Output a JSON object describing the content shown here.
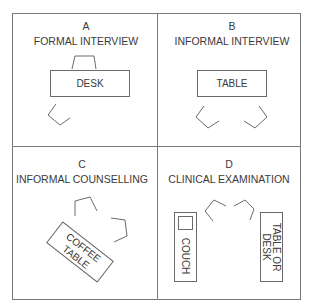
{
  "panels": [
    {
      "letter": "A",
      "title": "FORMAL INTERVIEW",
      "furniture": [
        "DESK"
      ],
      "chairs": 2
    },
    {
      "letter": "B",
      "title": "INFORMAL INTERVIEW",
      "furniture": [
        "TABLE"
      ],
      "chairs": 2
    },
    {
      "letter": "C",
      "title": "INFORMAL COUNSELLING",
      "furniture": [
        "COFFEE",
        "TABLE"
      ],
      "chairs": 2
    },
    {
      "letter": "D",
      "title": "CLINICAL EXAMINATION",
      "furniture": [
        "COUCH",
        "TABLE OR",
        "DESK"
      ],
      "chairs": 2
    }
  ],
  "colors": {
    "line": "#6a6a6a",
    "text": "#3a3a3a",
    "background": "#ffffff"
  }
}
